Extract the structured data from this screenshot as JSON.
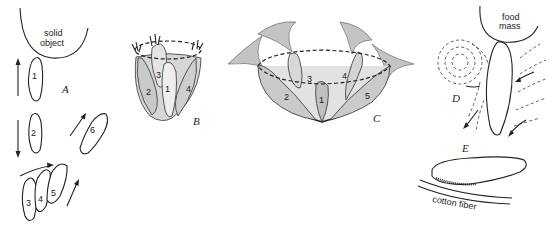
{
  "figure": {
    "panels": [
      {
        "id": "A",
        "letter": "A",
        "object_label_line1": "solid",
        "object_label_line2": "object",
        "cell_numbers": [
          "1",
          "2",
          "3",
          "4",
          "5",
          "6"
        ]
      },
      {
        "id": "B",
        "letter": "B",
        "cell_numbers": [
          "1",
          "2",
          "3",
          "4"
        ]
      },
      {
        "id": "C",
        "letter": "C",
        "cell_numbers": [
          "1",
          "2",
          "3",
          "4",
          "5"
        ]
      },
      {
        "id": "D",
        "letter": "D",
        "object_label_line1": "food",
        "object_label_line2": "mass"
      },
      {
        "id": "E",
        "letter": "E",
        "object_label": "cotton fiber"
      }
    ]
  }
}
